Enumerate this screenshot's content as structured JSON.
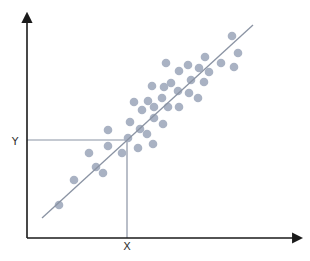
{
  "chart_data": {
    "type": "scatter",
    "title": "",
    "xlabel": "",
    "ylabel": "",
    "grid": false,
    "legend": null,
    "annotations": [
      {
        "text": "X",
        "kind": "x-marker-label"
      },
      {
        "text": "Y",
        "kind": "y-marker-label"
      }
    ],
    "coordinate_space": "pixel (310x261 canvas, origin top-left)",
    "axes": {
      "origin": [
        27,
        238
      ],
      "x_axis_end": [
        303,
        238
      ],
      "y_axis_end": [
        27,
        12
      ]
    },
    "marker": {
      "x": 127,
      "y": 140,
      "x_label": "X",
      "y_label": "Y"
    },
    "regression_line": {
      "x1": 42,
      "y1": 218,
      "x2": 253,
      "y2": 25
    },
    "points": [
      [
        59,
        205
      ],
      [
        74,
        180
      ],
      [
        89,
        153
      ],
      [
        96,
        167
      ],
      [
        103,
        173
      ],
      [
        108,
        130
      ],
      [
        108,
        146
      ],
      [
        122,
        153
      ],
      [
        128,
        138
      ],
      [
        130,
        122
      ],
      [
        138,
        148
      ],
      [
        140,
        129
      ],
      [
        147,
        134
      ],
      [
        153,
        144
      ],
      [
        134,
        102
      ],
      [
        142,
        110
      ],
      [
        148,
        101
      ],
      [
        154,
        107
      ],
      [
        154,
        118
      ],
      [
        163,
        124
      ],
      [
        152,
        86
      ],
      [
        162,
        98
      ],
      [
        164,
        87
      ],
      [
        168,
        107
      ],
      [
        171,
        83
      ],
      [
        178,
        91
      ],
      [
        179,
        107
      ],
      [
        166,
        63
      ],
      [
        179,
        71
      ],
      [
        188,
        65
      ],
      [
        191,
        80
      ],
      [
        189,
        93
      ],
      [
        198,
        98
      ],
      [
        204,
        82
      ],
      [
        199,
        68
      ],
      [
        209,
        72
      ],
      [
        205,
        57
      ],
      [
        221,
        63
      ],
      [
        234,
        67
      ],
      [
        238,
        53
      ],
      [
        232,
        36
      ]
    ],
    "colors": {
      "points": "#a9b2c3",
      "regression_line": "#8a93a3",
      "guides": "#8a93a3",
      "axes": "#1a1a1a"
    }
  },
  "labels": {
    "x_marker": "X",
    "y_marker": "Y"
  }
}
